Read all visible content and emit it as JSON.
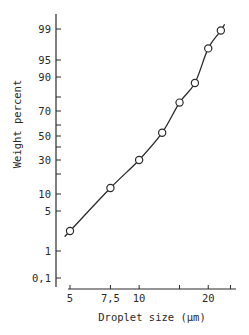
{
  "chart_data": {
    "type": "line",
    "title": "",
    "xlabel": "Droplet size (µm)",
    "ylabel": "Weight percent",
    "x_scale": "log",
    "y_scale": "probability",
    "xlim": [
      5,
      25
    ],
    "ylim": [
      0.1,
      99.9
    ],
    "grid": false,
    "legend": null,
    "x_ticks": [
      {
        "value": 5,
        "label": "5"
      },
      {
        "value": 7.5,
        "label": "7,5"
      },
      {
        "value": 10,
        "label": "10"
      },
      {
        "value": 15,
        "label": ""
      },
      {
        "value": 20,
        "label": "20"
      },
      {
        "value": 25,
        "label": ""
      }
    ],
    "y_ticks": [
      {
        "value": 0.1,
        "label": "0,1"
      },
      {
        "value": 1,
        "label": "1"
      },
      {
        "value": 5,
        "label": "5"
      },
      {
        "value": 10,
        "label": "10"
      },
      {
        "value": 20,
        "label": ""
      },
      {
        "value": 30,
        "label": "30"
      },
      {
        "value": 40,
        "label": ""
      },
      {
        "value": 50,
        "label": "50"
      },
      {
        "value": 60,
        "label": ""
      },
      {
        "value": 70,
        "label": "70"
      },
      {
        "value": 80,
        "label": ""
      },
      {
        "value": 90,
        "label": "90"
      },
      {
        "value": 95,
        "label": "95"
      },
      {
        "value": 99,
        "label": "99"
      }
    ],
    "series": [
      {
        "name": "Cumulative weight percent",
        "marker": "open-circle",
        "x": [
          5.0,
          7.5,
          10.0,
          12.6,
          15.0,
          17.5,
          20.0,
          22.7
        ],
        "y": [
          3,
          13,
          30,
          53,
          76,
          87,
          96.5,
          98.8
        ]
      }
    ]
  },
  "colors": {
    "ink": "#2a2a2a",
    "background": "#ffffff"
  }
}
